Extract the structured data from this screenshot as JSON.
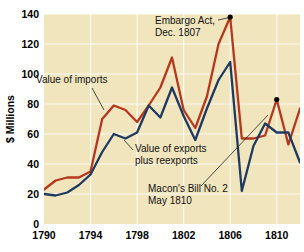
{
  "chart_data": {
    "type": "line",
    "title": "",
    "xlabel": "",
    "ylabel": "$ Millions",
    "xlim": [
      1790,
      1812
    ],
    "ylim": [
      0,
      140
    ],
    "ytick_step": 20,
    "xtick_step": 4,
    "grid": true,
    "legend_position": "inline-annotations",
    "background_color": "#f0e5bd",
    "x": [
      1790,
      1791,
      1792,
      1793,
      1794,
      1795,
      1796,
      1797,
      1798,
      1799,
      1800,
      1801,
      1802,
      1803,
      1804,
      1805,
      1806,
      1807,
      1808,
      1809,
      1810,
      1811,
      1812
    ],
    "yticks": [
      0,
      20,
      40,
      60,
      80,
      100,
      120,
      140
    ],
    "xticks": [
      1790,
      1794,
      1798,
      1802,
      1806,
      1810
    ],
    "series": [
      {
        "name": "Value of imports",
        "color": "#b5371f",
        "values": [
          23,
          29,
          31,
          31,
          35,
          70,
          79,
          76,
          68,
          79,
          91,
          111,
          76,
          64,
          85,
          120,
          138,
          57,
          57,
          59,
          83,
          53,
          77
        ]
      },
      {
        "name": "Value of exports plus reexports",
        "color": "#1e3a60",
        "values": [
          20,
          19,
          21,
          26,
          33,
          48,
          60,
          57,
          61,
          79,
          71,
          91,
          72,
          56,
          77,
          96,
          108,
          22,
          52,
          67,
          61,
          61,
          41
        ]
      }
    ],
    "annotations": [
      {
        "name": "embargo-act",
        "text_lines": [
          "Embargo Act,",
          "Dec. 1807"
        ],
        "point_x": 1806,
        "point_y": 138,
        "has_marker": true
      },
      {
        "name": "macons-bill",
        "text_lines": [
          "Macon's Bill No. 2",
          "May 1810"
        ],
        "point_x": 1810,
        "point_y": 83,
        "has_marker": true
      },
      {
        "name": "imports-label",
        "text_lines": [
          "Value of imports"
        ],
        "point_x": 1795.1,
        "point_y": 72,
        "has_marker": false
      },
      {
        "name": "exports-label",
        "text_lines": [
          "Value of exports",
          "plus reexports"
        ],
        "point_x": 1799.3,
        "point_y": 70,
        "has_marker": false
      }
    ]
  },
  "axis": {
    "y_title": "$ Millions",
    "y_tick_labels": [
      "0",
      "20",
      "40",
      "60",
      "80",
      "100",
      "120",
      "140"
    ],
    "x_tick_labels": [
      "1790",
      "1794",
      "1798",
      "1802",
      "1806",
      "1810"
    ]
  },
  "annotation_text": {
    "embargo_line1": "Embargo Act,",
    "embargo_line2": "Dec. 1807",
    "macons_line1": "Macon's Bill No. 2",
    "macons_line2": "May 1810",
    "imports_label": "Value of imports",
    "exports_line1": "Value of exports",
    "exports_line2": "plus reexports"
  },
  "colors": {
    "imports_line": "#b5371f",
    "exports_line": "#1e3a60",
    "plot_background": "#f0e5bd",
    "gridline": "#ffffff",
    "text": "#000000"
  }
}
